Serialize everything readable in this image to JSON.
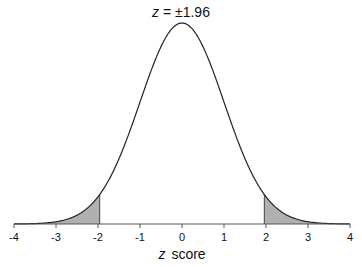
{
  "chart_data": {
    "type": "area",
    "title_var": "z",
    "title_rest": " = ±1.96",
    "title": "z = ±1.96",
    "xlabel_var": "z",
    "xlabel_rest": "score",
    "xlabel": "z score",
    "ylabel": "",
    "xlim": [
      -4,
      4
    ],
    "xticks": [
      -4,
      -3,
      -2,
      -1,
      0,
      1,
      2,
      3,
      4
    ],
    "xtick_labels": [
      "-4",
      "-3",
      "-2",
      "-1",
      "0",
      "1",
      "2",
      "3",
      "4"
    ],
    "grid": false,
    "legend": null,
    "curve": "standard normal density",
    "shaded_regions": [
      {
        "from": -4,
        "to": -1.96,
        "label": "lower tail"
      },
      {
        "from": 1.96,
        "to": 4,
        "label": "upper tail"
      }
    ],
    "critical_values": [
      -1.96,
      1.96
    ]
  },
  "colors": {
    "curve": "#222222",
    "shade": "#b0b0b0",
    "axis": "#555555",
    "text": "#111111"
  }
}
